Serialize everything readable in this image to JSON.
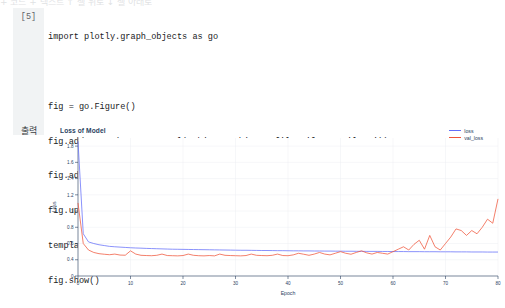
{
  "notebook": {
    "cell_number": "[5]",
    "output_label": "출력",
    "code_lines": [
      "import plotly.graph_objects as go",
      "",
      "fig = go.Figure()",
      "fig.add_trace(go.Scattergl(y=history.history['loss'],name='loss'))",
      "fig.add_trace(go.Scattergl(y=history.history['val_loss'],name='val_loss'))",
      "fig.update_layout(title=\"<b>Loss of Model</b>\", xaxis_title='Epoch',yaxis_title='Loss',",
      "template='plotly')",
      "fig.show()"
    ],
    "toolbar_ghost": "+ 코드  + 텍스트  ↑ 셀 위로  ↓ 셀 아래로"
  },
  "colors": {
    "loss": "#636efa",
    "val_loss": "#ef553b",
    "axis": "#2a3f5f",
    "grid": "#eceff3",
    "gutter": "#f1f3f4"
  },
  "chart_data": {
    "type": "line",
    "title": "Loss of Model",
    "xlabel": "Epoch",
    "ylabel": "Loss",
    "xlim": [
      0,
      80
    ],
    "ylim": [
      0.2,
      1.9
    ],
    "xticks": [
      0,
      10,
      20,
      30,
      40,
      50,
      60,
      70,
      80
    ],
    "yticks": [
      0.2,
      0.4,
      0.6,
      0.8,
      1,
      1.2,
      1.4,
      1.6,
      1.8
    ],
    "ytick_labels": [
      "0",
      "0.4",
      "0.6",
      "0.8",
      "1",
      "1.2",
      "1.4",
      "1.6",
      "1.8"
    ],
    "grid": true,
    "legend_position": "top-right",
    "x": [
      0,
      1,
      2,
      3,
      4,
      5,
      6,
      7,
      8,
      9,
      10,
      11,
      12,
      13,
      14,
      15,
      16,
      17,
      18,
      19,
      20,
      21,
      22,
      23,
      24,
      25,
      26,
      27,
      28,
      29,
      30,
      31,
      32,
      33,
      34,
      35,
      36,
      37,
      38,
      39,
      40,
      41,
      42,
      43,
      44,
      45,
      46,
      47,
      48,
      49,
      50,
      51,
      52,
      53,
      54,
      55,
      56,
      57,
      58,
      59,
      60,
      61,
      62,
      63,
      64,
      65,
      66,
      67,
      68,
      69,
      70,
      71,
      72,
      73,
      74,
      75,
      76,
      77,
      78,
      79,
      80
    ],
    "series": [
      {
        "name": "loss",
        "color": "#636efa",
        "values": [
          1.86,
          0.72,
          0.62,
          0.6,
          0.585,
          0.575,
          0.565,
          0.56,
          0.556,
          0.552,
          0.548,
          0.545,
          0.543,
          0.54,
          0.538,
          0.536,
          0.534,
          0.532,
          0.53,
          0.529,
          0.528,
          0.527,
          0.526,
          0.525,
          0.524,
          0.523,
          0.522,
          0.521,
          0.52,
          0.519,
          0.518,
          0.517,
          0.517,
          0.516,
          0.515,
          0.514,
          0.514,
          0.513,
          0.512,
          0.512,
          0.511,
          0.51,
          0.51,
          0.509,
          0.509,
          0.508,
          0.508,
          0.507,
          0.507,
          0.506,
          0.506,
          0.505,
          0.505,
          0.504,
          0.504,
          0.503,
          0.503,
          0.503,
          0.502,
          0.502,
          0.501,
          0.501,
          0.501,
          0.5,
          0.5,
          0.5,
          0.499,
          0.499,
          0.499,
          0.498,
          0.498,
          0.498,
          0.497,
          0.497,
          0.497,
          0.496,
          0.496,
          0.496,
          0.495,
          0.495,
          0.495
        ]
      },
      {
        "name": "val_loss",
        "color": "#ef553b",
        "values": [
          1.1,
          0.6,
          0.52,
          0.49,
          0.475,
          0.468,
          0.462,
          0.47,
          0.458,
          0.456,
          0.51,
          0.47,
          0.455,
          0.452,
          0.45,
          0.455,
          0.47,
          0.452,
          0.45,
          0.448,
          0.452,
          0.47,
          0.455,
          0.45,
          0.448,
          0.452,
          0.448,
          0.47,
          0.455,
          0.452,
          0.45,
          0.448,
          0.452,
          0.47,
          0.455,
          0.452,
          0.45,
          0.455,
          0.47,
          0.452,
          0.45,
          0.46,
          0.48,
          0.468,
          0.455,
          0.47,
          0.49,
          0.47,
          0.46,
          0.48,
          0.5,
          0.48,
          0.468,
          0.49,
          0.51,
          0.485,
          0.47,
          0.49,
          0.48,
          0.47,
          0.5,
          0.53,
          0.56,
          0.52,
          0.59,
          0.64,
          0.53,
          0.7,
          0.56,
          0.52,
          0.6,
          0.68,
          0.78,
          0.76,
          0.7,
          0.76,
          0.72,
          0.8,
          0.9,
          0.85,
          1.15
        ]
      }
    ]
  }
}
